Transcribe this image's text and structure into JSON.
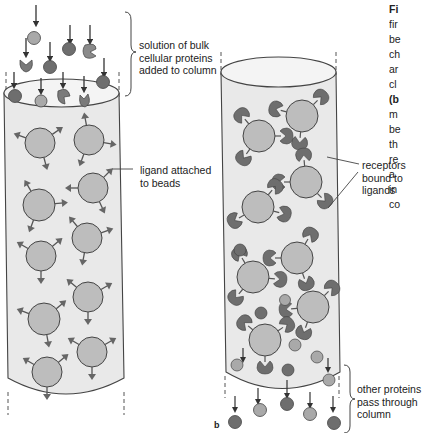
{
  "labels": {
    "solution": "solution of bulk\ncellular proteins\nadded to column",
    "ligand": "ligand attached\nto beads",
    "receptors": "receptors\nbound to\nligands",
    "other": "other proteins\npass through\ncolumn",
    "panel_mark": "b"
  },
  "caption_fragment": {
    "lines": [
      {
        "text": "Fi",
        "bold": true
      },
      {
        "text": "fir",
        "bold": false
      },
      {
        "text": "be",
        "bold": false
      },
      {
        "text": "ch",
        "bold": false
      },
      {
        "text": "ar",
        "bold": false
      },
      {
        "text": "cl",
        "bold": false
      },
      {
        "text": "(b",
        "bold": true
      },
      {
        "text": "m",
        "bold": false
      },
      {
        "text": "be",
        "bold": false
      },
      {
        "text": "th",
        "bold": false
      },
      {
        "text": "re",
        "bold": false
      },
      {
        "text": "a",
        "bold": false
      },
      {
        "text": "in",
        "bold": false
      },
      {
        "text": "co",
        "bold": false
      }
    ]
  },
  "colors": {
    "column_fill": "#e9e9e9",
    "bead_fill": "#bdbdbd",
    "protein_dark": "#6e6e6e",
    "protein_light": "#a9a9a9",
    "outline": "#4a4a4a",
    "text": "#222222"
  }
}
